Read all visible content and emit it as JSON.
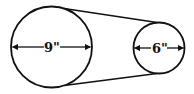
{
  "diagram": {
    "type": "belt-and-pulley",
    "large_pulley": {
      "diameter_label": "9\"",
      "cx": 51.5,
      "cy": 47,
      "r": 40.5
    },
    "small_pulley": {
      "diameter_label": "6\"",
      "cx": 159,
      "cy": 48,
      "r": 25.5
    },
    "colors": {
      "stroke": "#111111",
      "background": "#ffffff"
    }
  }
}
